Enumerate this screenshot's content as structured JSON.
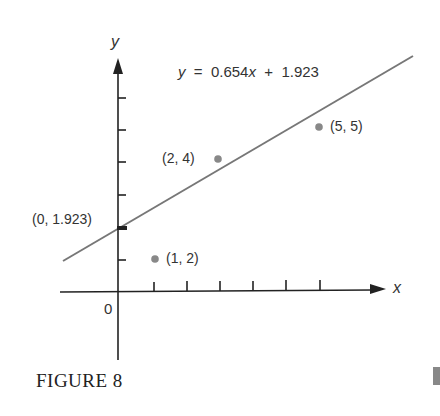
{
  "chart_data": {
    "type": "scatter",
    "title": "",
    "xlabel": "x",
    "ylabel": "y",
    "origin_label": "0",
    "x_ticks": [
      1,
      2,
      3,
      4,
      5,
      6
    ],
    "y_ticks": [
      1,
      2,
      3,
      4,
      5,
      6
    ],
    "points": [
      {
        "x": 1,
        "y": 2,
        "label": "(1, 2)"
      },
      {
        "x": 2,
        "y": 4,
        "label": "(2, 4)"
      },
      {
        "x": 5,
        "y": 5,
        "label": "(5, 5)"
      }
    ],
    "intercept_point": {
      "x": 0,
      "y": 1.923,
      "label": "(0, 1.923)"
    },
    "regression_line": {
      "slope": 0.654,
      "intercept": 1.923,
      "equation": "y = 0.654x + 1.923"
    },
    "grid": false,
    "legend": null
  },
  "figure": {
    "caption": "FIGURE 8"
  },
  "colors": {
    "axis": "#222222",
    "line": "#777777",
    "points": "#888888",
    "text": "#333333"
  }
}
